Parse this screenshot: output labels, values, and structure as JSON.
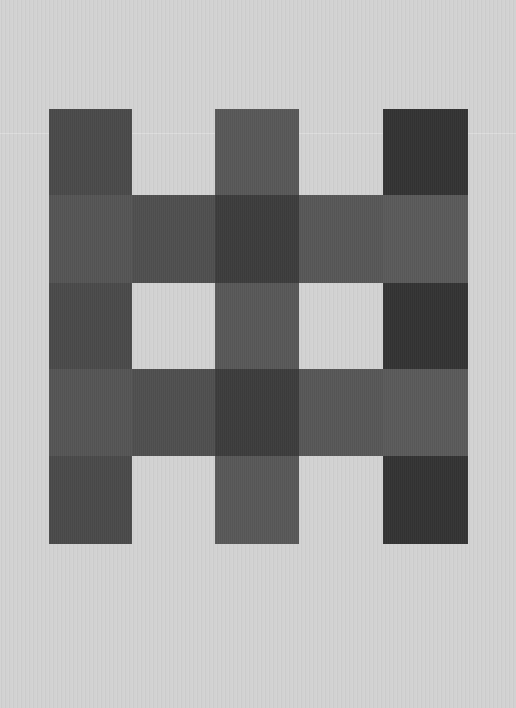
{
  "canvas": {
    "width": 516,
    "height": 708,
    "background_color": "#d2d2d2"
  },
  "pattern": {
    "description": "5x5 lattice pattern of gray squares: three vertical columns crossed by two horizontal bands",
    "grid_origin": [
      49,
      109
    ],
    "column_edges": [
      0,
      83,
      166,
      250,
      334,
      419
    ],
    "row_edges": [
      0,
      86,
      174,
      260,
      347,
      435
    ],
    "cells": [
      {
        "row": 0,
        "col": 0,
        "color": "#4a4a4a"
      },
      {
        "row": 0,
        "col": 2,
        "color": "#585858"
      },
      {
        "row": 0,
        "col": 4,
        "color": "#333333"
      },
      {
        "row": 1,
        "col": 0,
        "color": "#555555"
      },
      {
        "row": 1,
        "col": 1,
        "color": "#4f4f4f"
      },
      {
        "row": 1,
        "col": 2,
        "color": "#3c3c3c"
      },
      {
        "row": 1,
        "col": 3,
        "color": "#575757"
      },
      {
        "row": 1,
        "col": 4,
        "color": "#5a5a5a"
      },
      {
        "row": 2,
        "col": 0,
        "color": "#4a4a4a"
      },
      {
        "row": 2,
        "col": 2,
        "color": "#585858"
      },
      {
        "row": 2,
        "col": 4,
        "color": "#333333"
      },
      {
        "row": 3,
        "col": 0,
        "color": "#555555"
      },
      {
        "row": 3,
        "col": 1,
        "color": "#4f4f4f"
      },
      {
        "row": 3,
        "col": 2,
        "color": "#3c3c3c"
      },
      {
        "row": 3,
        "col": 3,
        "color": "#575757"
      },
      {
        "row": 3,
        "col": 4,
        "color": "#5a5a5a"
      },
      {
        "row": 4,
        "col": 0,
        "color": "#4a4a4a"
      },
      {
        "row": 4,
        "col": 2,
        "color": "#585858"
      },
      {
        "row": 4,
        "col": 4,
        "color": "#333333"
      }
    ]
  }
}
